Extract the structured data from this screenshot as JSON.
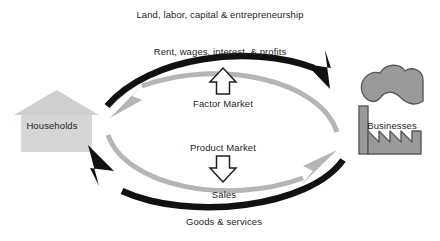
{
  "diagram": {
    "type": "circular-flow",
    "background": "#ffffff",
    "width": 440,
    "height": 241
  },
  "colors": {
    "flow_dark": "#111111",
    "flow_light": "#b5b5b5",
    "house_body": "#d6d6d6",
    "house_roof": "#cfcfcf",
    "factory_fill": "#9a9a9a",
    "factory_stroke": "#58595b",
    "text": "#231f20",
    "arrow_outline_fill": "#ffffff",
    "arrow_outline_stroke": "#231f20"
  },
  "actors": [
    {
      "id": "households",
      "label": "Households",
      "icon": "house-icon",
      "side": "left"
    },
    {
      "id": "businesses",
      "label": "Businesses",
      "icon": "factory-icon",
      "side": "right"
    }
  ],
  "markets": [
    {
      "id": "factor-market",
      "label": "Factor Market",
      "marker": "up-arrow-icon",
      "position": "upper-middle"
    },
    {
      "id": "product-market",
      "label": "Product Market",
      "marker": "down-arrow-icon",
      "position": "lower-middle"
    }
  ],
  "flows": [
    {
      "id": "resources",
      "label": "Land, labor, capital & entrepreneurship",
      "color": "flow_dark",
      "from": "households",
      "to": "businesses",
      "path": "top-outer",
      "direction": "left-to-right"
    },
    {
      "id": "income",
      "label": "Rent, wages, interest, & profits",
      "color": "flow_light",
      "from": "businesses",
      "to": "households",
      "path": "top-inner",
      "direction": "right-to-left"
    },
    {
      "id": "sales",
      "label": "Sales",
      "color": "flow_light",
      "from": "households",
      "to": "businesses",
      "path": "bottom-inner",
      "direction": "left-to-right"
    },
    {
      "id": "goods-services",
      "label": "Goods & services",
      "color": "flow_dark",
      "from": "businesses",
      "to": "households",
      "path": "bottom-outer",
      "direction": "right-to-left"
    }
  ]
}
